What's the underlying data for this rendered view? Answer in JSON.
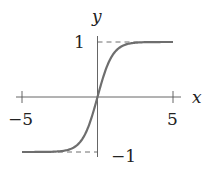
{
  "chart_data": {
    "type": "line",
    "title": "",
    "function": "tanh(x)",
    "xlabel": "x",
    "ylabel": "y",
    "xlim": [
      -5,
      5
    ],
    "ylim": [
      -1,
      1
    ],
    "x_ticks": [
      -5,
      5
    ],
    "x_tick_labels": [
      "−5",
      "5"
    ],
    "y_tick_labels": [
      "1",
      "−1"
    ],
    "asymptotes": [
      1,
      -1
    ],
    "grid": false,
    "legend": null,
    "series": [
      {
        "name": "tanh",
        "x": [
          -5,
          -4,
          -3,
          -2,
          -1.5,
          -1,
          -0.5,
          0,
          0.5,
          1,
          1.5,
          2,
          3,
          4,
          5
        ],
        "values": [
          -0.9999,
          -0.9993,
          -0.9951,
          -0.964,
          -0.9051,
          -0.7616,
          -0.4621,
          0,
          0.4621,
          0.7616,
          0.9051,
          0.964,
          0.9951,
          0.9993,
          0.9999
        ]
      }
    ],
    "colors": {
      "curve": "#6e6e6e",
      "axes": "#555555",
      "dashed": "#6e6e6e"
    }
  },
  "labels": {
    "x_axis": "x",
    "y_axis": "y",
    "x_min": "−5",
    "x_max": "5",
    "y_max": "1",
    "y_min": "−1"
  }
}
